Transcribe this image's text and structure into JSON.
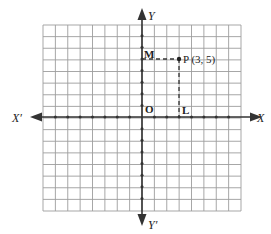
{
  "diagram": {
    "type": "cartesian-plane",
    "grid": {
      "columns": 16,
      "rows": 16,
      "x_range": [
        -8,
        8
      ],
      "y_range": [
        -8,
        8
      ]
    },
    "axes": {
      "x_positive_label": "X",
      "x_negative_label": "X′",
      "y_positive_label": "Y",
      "y_negative_label": "Y′",
      "origin_label": "O"
    },
    "point": {
      "label": "P (3, 5)",
      "x": 3,
      "y": 5
    },
    "projections": {
      "on_x_axis": {
        "label": "L",
        "x": 3,
        "y": 0
      },
      "on_y_axis": {
        "label": "M",
        "x": 0,
        "y": 5
      }
    },
    "colors": {
      "grid": "#9a9a9a",
      "axis": "#333333",
      "text": "#222222"
    }
  }
}
